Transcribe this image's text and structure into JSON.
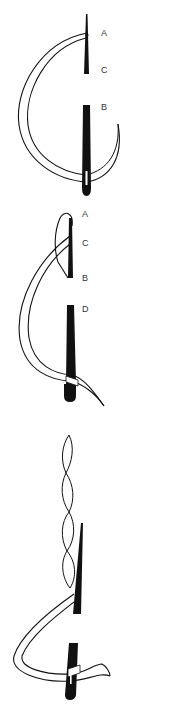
{
  "diagram": {
    "type": "stitch-illustration",
    "colors": {
      "ink": "#111111",
      "thread_fill": "#ffffff",
      "label": "#333333",
      "background": "#ffffff"
    },
    "figures": [
      {
        "step": 1,
        "description": "Curved needle/thread loop passing from A down around to B",
        "labels": [
          {
            "text": "A",
            "x": 101,
            "y": 29
          },
          {
            "text": "C",
            "x": 101,
            "y": 66
          },
          {
            "text": "B",
            "x": 101,
            "y": 103
          }
        ]
      },
      {
        "step": 2,
        "description": "Thread looped at A, crossing C and B, continuing to D",
        "labels": [
          {
            "text": "A",
            "x": 82,
            "y": 210
          },
          {
            "text": "C",
            "x": 82,
            "y": 239
          },
          {
            "text": "B",
            "x": 82,
            "y": 274
          },
          {
            "text": "D",
            "x": 82,
            "y": 305
          }
        ]
      },
      {
        "step": 3,
        "description": "Twisted completed stitch line with thread hooking around the final needle",
        "labels": []
      }
    ]
  }
}
